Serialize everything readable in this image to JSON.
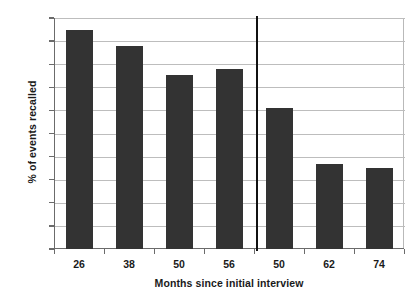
{
  "chart_data": {
    "type": "bar",
    "title": "",
    "subtitle": "",
    "xlabel": "Months since initial interview",
    "ylabel": "% of events recalled",
    "categories": [
      "26",
      "38",
      "50",
      "56",
      "50",
      "62",
      "74"
    ],
    "values": [
      95,
      88,
      75.5,
      78,
      61,
      37,
      35
    ],
    "series": [
      {
        "name": "% of events recalled",
        "values": [
          95,
          88,
          75.5,
          78,
          61,
          37,
          35
        ]
      }
    ],
    "ylim": [
      0,
      100
    ],
    "ytick_step": 10,
    "yticks": [
      "100",
      "90",
      "80",
      "70",
      "60",
      "50",
      "40",
      "30",
      "20",
      "10",
      "0"
    ],
    "grid": "horizontal",
    "legend": "none",
    "bar_color": "#333333",
    "gridline_color": "#bdbdbd",
    "axis_color": "#6b6b6b",
    "background_color": "#ffffff",
    "annotations": [
      {
        "name": "group-divider",
        "type": "vertical-line",
        "after_category_index": 3,
        "color": "#111111"
      }
    ]
  }
}
